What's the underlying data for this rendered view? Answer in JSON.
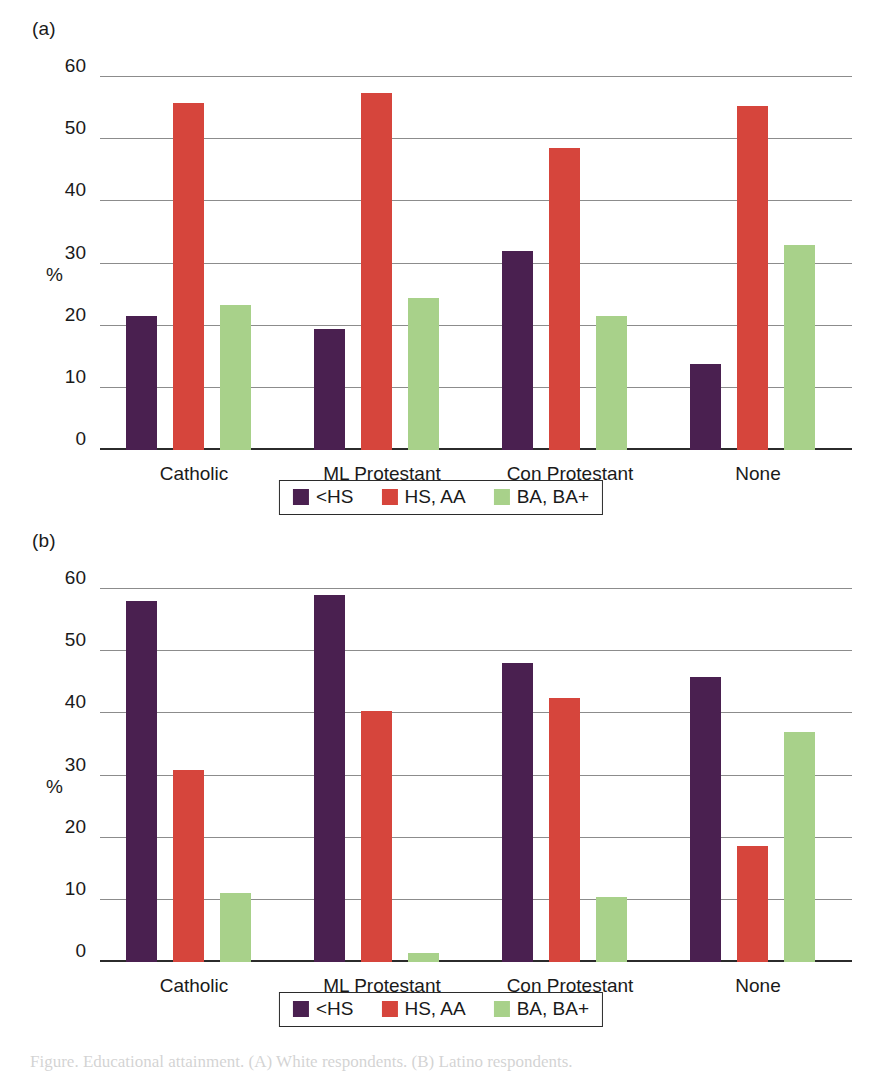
{
  "figure": {
    "panels": [
      {
        "tag": "(a)",
        "name": "panel-a"
      },
      {
        "tag": "(b)",
        "name": "panel-b"
      }
    ],
    "caption": "Figure. Educational attainment. (A) White respondents. (B) Latino respondents."
  },
  "axis": {
    "y_title": "%",
    "y_ticks": [
      "0",
      "10",
      "20",
      "30",
      "40",
      "50",
      "60"
    ],
    "x_categories": [
      "Catholic",
      "ML Protestant",
      "Con Protestant",
      "None"
    ]
  },
  "legend": {
    "entries": [
      {
        "label": "<HS",
        "color": "#4a2050"
      },
      {
        "label": "HS, AA",
        "color": "#d6453c"
      },
      {
        "label": "BA, BA+",
        "color": "#a8d18a"
      }
    ]
  },
  "colors": {
    "series_less_than_hs": "#4a2050",
    "series_hs_aa": "#d6453c",
    "series_ba_plus": "#a8d18a",
    "gridline": "#8c8c8c",
    "axis": "#2b2b2b",
    "background": "#ffffff"
  },
  "chart_data": [
    {
      "type": "bar",
      "panel": "(a)",
      "title": "",
      "xlabel": "",
      "ylabel": "%",
      "ylim": [
        0,
        60
      ],
      "yticks": [
        0,
        10,
        20,
        30,
        40,
        50,
        60
      ],
      "grid": true,
      "legend_position": "bottom-center",
      "categories": [
        "Catholic",
        "ML Protestant",
        "Con Protestant",
        "None"
      ],
      "series": [
        {
          "name": "<HS",
          "color": "#4a2050",
          "values": [
            21.5,
            19.5,
            32.0,
            13.8
          ]
        },
        {
          "name": "HS, AA",
          "color": "#d6453c",
          "values": [
            55.8,
            57.5,
            48.6,
            55.3
          ]
        },
        {
          "name": "BA, BA+",
          "color": "#a8d18a",
          "values": [
            23.4,
            24.4,
            21.5,
            33.0
          ]
        }
      ]
    },
    {
      "type": "bar",
      "panel": "(b)",
      "title": "",
      "xlabel": "",
      "ylabel": "%",
      "ylim": [
        0,
        60
      ],
      "yticks": [
        0,
        10,
        20,
        30,
        40,
        50,
        60
      ],
      "grid": true,
      "legend_position": "bottom-center",
      "categories": [
        "Catholic",
        "ML Protestant",
        "Con Protestant",
        "None"
      ],
      "series": [
        {
          "name": "<HS",
          "color": "#4a2050",
          "values": [
            58.1,
            59.0,
            48.1,
            45.8
          ]
        },
        {
          "name": "HS, AA",
          "color": "#d6453c",
          "values": [
            30.9,
            40.3,
            42.4,
            18.7
          ]
        },
        {
          "name": "BA, BA+",
          "color": "#a8d18a",
          "values": [
            11.1,
            1.4,
            10.5,
            37.0
          ]
        }
      ]
    }
  ]
}
